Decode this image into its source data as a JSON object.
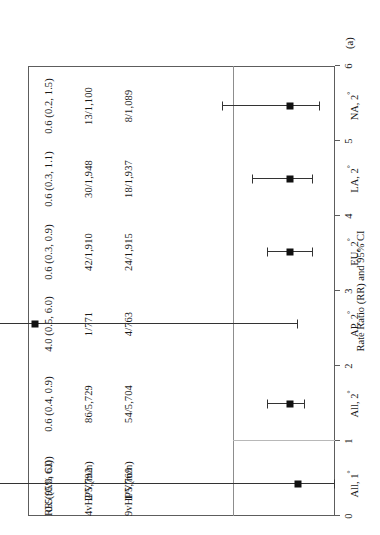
{
  "figure": {
    "panel_tag": "(a)",
    "axis_title": "Rate Ratio (RR) and 95% CI",
    "columns": {
      "col9v_header": "9vHPV(m/n)",
      "col4v_header": "4vHPV(m/n)",
      "colrr_header": "RR (95% CI)"
    }
  },
  "chart_data": {
    "type": "forest",
    "title": "",
    "xlabel": "Rate Ratio (RR) and 95% CI",
    "ylabel": "",
    "xlim": [
      0,
      6
    ],
    "xticks": [
      0,
      1,
      2,
      3,
      4,
      5,
      6
    ],
    "xtick_labels": [
      "0",
      "1",
      "2",
      "3",
      "4",
      "5",
      "6"
    ],
    "reference_line": 1,
    "grid": false,
    "legend": "none",
    "marker_color": "#111111",
    "line_color": "#333333",
    "categories": [
      "All, 1°",
      "All, 2°",
      "AP, 2°",
      "EU, 2°",
      "LA, 2°",
      "NA, 2°"
    ],
    "rows": [
      {
        "label": "All, 1",
        "label_sup": "°",
        "nine_v": "1/5,769",
        "four_v": "2/5,792",
        "rr_text": "0.5 (0.0, 6.0)",
        "rr": 0.5,
        "ci_low": 0.0,
        "ci_high": 6.0
      },
      {
        "label": "All, 2",
        "label_sup": "°",
        "nine_v": "54/5,704",
        "four_v": "86/5,729",
        "rr_text": "0.6 (0.4, 0.9)",
        "rr": 0.6,
        "ci_low": 0.4,
        "ci_high": 0.9
      },
      {
        "label": "AP, 2",
        "label_sup": "°",
        "nine_v": "4/763",
        "four_v": "1/771",
        "rr_text": "4.0 (0.5, 6.0)",
        "rr": 4.0,
        "ci_low": 0.5,
        "ci_high": 6.0
      },
      {
        "label": "EU, 2",
        "label_sup": "°",
        "nine_v": "24/1,915",
        "four_v": "42/1,910",
        "rr_text": "0.6 (0.3, 0.9)",
        "rr": 0.6,
        "ci_low": 0.3,
        "ci_high": 0.9
      },
      {
        "label": "LA, 2",
        "label_sup": "°",
        "nine_v": "18/1,937",
        "four_v": "30/1,948",
        "rr_text": "0.6 (0.3, 1.1)",
        "rr": 0.6,
        "ci_low": 0.3,
        "ci_high": 1.1
      },
      {
        "label": "NA, 2",
        "label_sup": "°",
        "nine_v": "8/1,089",
        "four_v": "13/1,100",
        "rr_text": "0.6 (0.2, 1.5)",
        "rr": 0.6,
        "ci_low": 0.2,
        "ci_high": 1.5
      }
    ]
  }
}
